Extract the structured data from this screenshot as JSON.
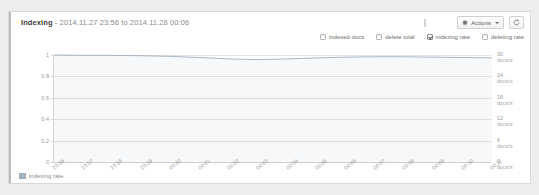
{
  "panel": {
    "title_name": "Indexing",
    "title_sep": " - ",
    "title_range": "2014.11.27 23:56 to 2014.11.28 00:06"
  },
  "toolbar": {
    "actions_label": "Actions",
    "actions_icon": "gear-icon",
    "refresh_icon": "refresh-icon",
    "loading_icon": "loading-bar-icon"
  },
  "legend_checkboxes": [
    {
      "label": "indexed docs",
      "checked": false
    },
    {
      "label": "delete total",
      "checked": false
    },
    {
      "label": "indexing rate",
      "checked": true
    },
    {
      "label": "deleting rate",
      "checked": false
    }
  ],
  "footer_legend": {
    "label": "indexing rate",
    "color": "#a8b6c4"
  },
  "chart_data": {
    "type": "line",
    "title": "Indexing - 2014.11.27 23:56 to 2014.11.28 00:06",
    "xlabel": "",
    "ylabel": "",
    "grid": true,
    "legend_position": "bottom-left",
    "y_left": {
      "ticks": [
        "1",
        "0.8",
        "0.6",
        "0.4",
        "0.2",
        "0"
      ],
      "values": [
        1,
        0.8,
        0.6,
        0.4,
        0.2,
        0
      ],
      "ylim": [
        0,
        1
      ]
    },
    "y_right": {
      "ticks": [
        "30",
        "24",
        "18",
        "12",
        "6",
        "0"
      ],
      "values": [
        30,
        24,
        18,
        12,
        6,
        0
      ],
      "unit": "docs/s",
      "ylim": [
        0,
        30
      ]
    },
    "x": [
      "23:56",
      "23:57",
      "23:58",
      "23:59",
      "00:00",
      "00:01",
      "00:02",
      "00:03",
      "00:04",
      "00:05",
      "00:06",
      "00:07",
      "00:08",
      "00:09",
      "00:10",
      "00:11"
    ],
    "series": [
      {
        "name": "indexing rate",
        "color": "#a8b6c4",
        "unit": "docs/s",
        "values": [
          30.0,
          29.9,
          29.9,
          29.8,
          29.6,
          29.3,
          28.9,
          28.7,
          28.9,
          29.2,
          29.4,
          29.5,
          29.5,
          29.4,
          29.3,
          29.2
        ]
      }
    ]
  }
}
